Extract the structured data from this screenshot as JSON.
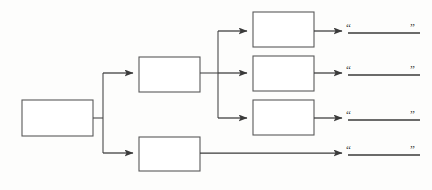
{
  "diagram": {
    "type": "tree-flowchart",
    "background_color": "#fdfdfc",
    "box_fill_color": "#ffffff",
    "box_stroke_color": "#5a5a5a",
    "connector_color": "#3a3a3a",
    "text_color": "#2e2e2e",
    "nodes": [
      {
        "id": "root",
        "label": "",
        "level": 0,
        "x": 22,
        "y": 100,
        "width": 71,
        "height": 36
      },
      {
        "id": "mid-1",
        "label": "",
        "level": 1,
        "x": 139,
        "y": 57,
        "width": 61,
        "height": 35
      },
      {
        "id": "mid-2",
        "label": "",
        "level": 1,
        "x": 139,
        "y": 137,
        "width": 61,
        "height": 34
      },
      {
        "id": "leaf-1",
        "label": "",
        "level": 2,
        "x": 253,
        "y": 12,
        "width": 61,
        "height": 35
      },
      {
        "id": "leaf-2",
        "label": "",
        "level": 2,
        "x": 253,
        "y": 56,
        "width": 61,
        "height": 35
      },
      {
        "id": "leaf-3",
        "label": "",
        "level": 2,
        "x": 253,
        "y": 100,
        "width": 61,
        "height": 35
      }
    ],
    "answer_lines": [
      {
        "id": "answer-1",
        "open_quote": "“",
        "close_quote": "”",
        "value": "",
        "x": 348,
        "y": 31,
        "width": 72
      },
      {
        "id": "answer-2",
        "open_quote": "“",
        "close_quote": "”",
        "value": "",
        "x": 348,
        "y": 73,
        "width": 72
      },
      {
        "id": "answer-3",
        "open_quote": "“",
        "close_quote": "”",
        "value": "",
        "x": 348,
        "y": 118,
        "width": 72
      },
      {
        "id": "answer-4",
        "open_quote": "“",
        "close_quote": "”",
        "value": "",
        "x": 348,
        "y": 153,
        "width": 72
      }
    ],
    "connectors": [
      {
        "id": "root-to-trunk",
        "from": "root",
        "to": "trunk-1",
        "arrow": false,
        "path": "M 93 118 L 103 118"
      },
      {
        "id": "trunk-1",
        "from": "trunk",
        "to": "branch",
        "arrow": false,
        "path": "M 103 72 L 103 152"
      },
      {
        "id": "trunk-to-mid-1",
        "from": "trunk",
        "to": "mid-1",
        "arrow": true,
        "path": "M 103 73 L 133 73"
      },
      {
        "id": "trunk-to-mid-2",
        "from": "trunk",
        "to": "mid-2",
        "arrow": true,
        "path": "M 103 153 L 133 153"
      },
      {
        "id": "mid-1-to-trunk-2",
        "from": "mid-1",
        "to": "trunk-2",
        "arrow": false,
        "path": "M 200 73 L 218 73"
      },
      {
        "id": "trunk-2",
        "from": "trunk2",
        "to": "leaves",
        "arrow": false,
        "path": "M 218 31 L 218 118"
      },
      {
        "id": "trunk-to-leaf-1",
        "from": "trunk2",
        "to": "leaf-1",
        "arrow": true,
        "path": "M 218 31 L 247 31"
      },
      {
        "id": "trunk-to-leaf-2",
        "from": "trunk2",
        "to": "leaf-2",
        "arrow": true,
        "path": "M 218 73 L 247 73"
      },
      {
        "id": "trunk-to-leaf-3",
        "from": "trunk2",
        "to": "leaf-3",
        "arrow": true,
        "path": "M 218 118 L 247 118"
      },
      {
        "id": "leaf-1-to-answer",
        "from": "leaf-1",
        "to": "answer-1",
        "arrow": true,
        "path": "M 314 31 L 342 31"
      },
      {
        "id": "leaf-2-to-answer",
        "from": "leaf-2",
        "to": "answer-2",
        "arrow": true,
        "path": "M 314 73 L 342 73"
      },
      {
        "id": "leaf-3-to-answer",
        "from": "leaf-3",
        "to": "answer-3",
        "arrow": true,
        "path": "M 314 118 L 342 118"
      },
      {
        "id": "mid-2-to-answer",
        "from": "mid-2",
        "to": "answer-4",
        "arrow": true,
        "path": "M 200 153 L 342 153"
      }
    ]
  }
}
